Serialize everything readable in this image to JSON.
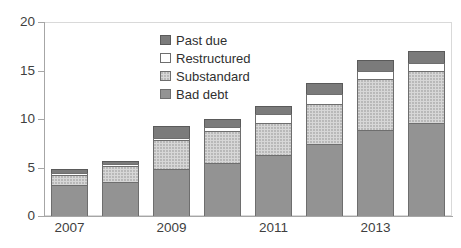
{
  "chart_data": {
    "type": "bar",
    "stacked": true,
    "title": "",
    "subtitle": "",
    "xlabel": "",
    "ylabel": "",
    "ylim": [
      0,
      20
    ],
    "yticks": [
      0,
      5,
      10,
      15,
      20
    ],
    "grid": false,
    "legend_position": "inside-top-center",
    "categories": [
      "2007",
      "2008",
      "2009",
      "2010",
      "2011",
      "2012",
      "2013",
      "2014"
    ],
    "tick_labels_shown": [
      "2007",
      "2009",
      "2011",
      "2013"
    ],
    "series": [
      {
        "name": "Bad debt",
        "color": "#939393",
        "values": [
          3.2,
          3.5,
          4.8,
          5.5,
          6.3,
          7.4,
          8.9,
          9.6
        ]
      },
      {
        "name": "Substandard",
        "color": "#d7d7d7",
        "values": [
          1.0,
          1.7,
          3.0,
          3.3,
          3.3,
          4.2,
          5.2,
          5.4
        ]
      },
      {
        "name": "Restructured",
        "color": "#ffffff",
        "values": [
          0.2,
          0.2,
          0.2,
          0.4,
          0.9,
          1.0,
          0.8,
          0.8
        ]
      },
      {
        "name": "Past due",
        "color": "#7b7b7b",
        "values": [
          0.5,
          0.3,
          1.3,
          0.8,
          0.8,
          1.1,
          1.2,
          1.2
        ]
      }
    ],
    "totals": [
      4.9,
      5.7,
      9.3,
      10.0,
      11.3,
      13.7,
      16.1,
      17.0
    ]
  },
  "axis": {
    "y_labels": [
      "20",
      "15",
      "10",
      "5",
      "0"
    ],
    "x_labels": [
      "2007",
      "2009",
      "2011",
      "2013"
    ]
  },
  "legend": {
    "items": [
      {
        "label": "Past due",
        "swatch": "past-due-swatch"
      },
      {
        "label": "Restructured",
        "swatch": "restructured-swatch"
      },
      {
        "label": "Substandard",
        "swatch": "substandard-swatch"
      },
      {
        "label": "Bad debt",
        "swatch": "bad-debt-swatch"
      }
    ]
  },
  "colors": {
    "past_due": "#7b7b7b",
    "restructured": "#ffffff",
    "substandard": "#d7d7d7",
    "bad_debt": "#939393",
    "axis": "#a6a6a6",
    "text": "#3f3f3f",
    "background": "#ffffff"
  }
}
